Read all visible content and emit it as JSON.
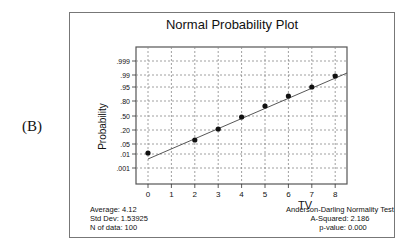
{
  "panel_label": "(B)",
  "chart_data": {
    "type": "scatter",
    "title": "Normal Probability Plot",
    "xlabel": "TV",
    "ylabel": "Probability",
    "x_ticks": [
      "0",
      "1",
      "2",
      "3",
      "4",
      "5",
      "6",
      "7",
      "8"
    ],
    "y_ticks": [
      ".999",
      ".99",
      ".95",
      ".80",
      ".50",
      ".20",
      ".05",
      ".01",
      ".001"
    ],
    "xlim": [
      0,
      8
    ],
    "grid": true,
    "points": [
      {
        "x": 0,
        "p": 0.01
      },
      {
        "x": 2,
        "p": 0.06
      },
      {
        "x": 3,
        "p": 0.21
      },
      {
        "x": 4,
        "p": 0.45
      },
      {
        "x": 5,
        "p": 0.7
      },
      {
        "x": 6,
        "p": 0.84
      },
      {
        "x": 7,
        "p": 0.94
      },
      {
        "x": 8,
        "p": 0.99
      }
    ],
    "fit_line": {
      "from": {
        "x": 0,
        "p": 0.0035
      },
      "to": {
        "x": 8,
        "p": 0.99
      }
    },
    "stats_left": {
      "average": "Average: 4.12",
      "std_dev": "Std Dev: 1.53925",
      "n": "N of data: 100"
    },
    "stats_right": {
      "test": "Anderson-Darling Normality Test",
      "a_squared": "A-Squared: 2.186",
      "p_value": "p-value:  0.000"
    }
  }
}
